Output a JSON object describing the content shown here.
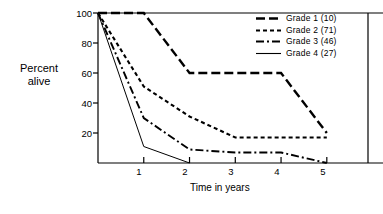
{
  "chart_data": {
    "type": "line",
    "title": "",
    "xlabel": "Time in years",
    "ylabel": "Percent alive",
    "ylabel_lines": [
      "Percent",
      "alive"
    ],
    "xlim": [
      0,
      5.9
    ],
    "ylim": [
      0,
      100
    ],
    "x_ticks": [
      "1",
      "2",
      "3",
      "4",
      "5"
    ],
    "x_tick_values": [
      1,
      2,
      3,
      4,
      5
    ],
    "y_ticks": [
      "20",
      "40",
      "60",
      "80",
      "100"
    ],
    "y_tick_values": [
      20,
      40,
      60,
      80,
      100
    ],
    "grid": false,
    "legend_position": "top-right",
    "line_color": "#000000",
    "series": [
      {
        "name": "Grade 1 (10)",
        "label": "Grade 1 (10)",
        "group": "Grade 1",
        "n": 10,
        "style": "long-dash",
        "dasharray": "9,4",
        "width": 2.4,
        "x": [
          0,
          1,
          2,
          4,
          5
        ],
        "values": [
          100,
          100,
          60,
          60,
          20
        ]
      },
      {
        "name": "Grade 2 (71)",
        "label": "Grade 2 (71)",
        "group": "Grade 2",
        "n": 71,
        "style": "short-dash",
        "dasharray": "4,3",
        "width": 2.1,
        "x": [
          0,
          1,
          2,
          3,
          5
        ],
        "values": [
          100,
          51,
          31,
          17,
          17
        ]
      },
      {
        "name": "Grade 3 (46)",
        "label": "Grade 3 (46)",
        "group": "Grade 3",
        "n": 46,
        "style": "dash-dot",
        "dasharray": "8,3,2,3",
        "width": 1.9,
        "x": [
          0,
          1,
          2,
          3,
          4,
          5
        ],
        "values": [
          100,
          30,
          9,
          7,
          7,
          0
        ]
      },
      {
        "name": "Grade 4 (27)",
        "label": "Grade 4 (27)",
        "group": "Grade 4",
        "n": 27,
        "style": "solid",
        "dasharray": "none",
        "width": 1.0,
        "x": [
          0,
          1,
          2
        ],
        "values": [
          100,
          11,
          0
        ]
      }
    ]
  }
}
